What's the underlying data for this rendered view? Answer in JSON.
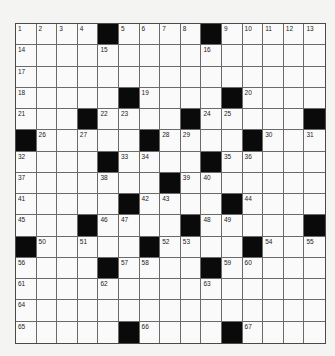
{
  "puzzle": {
    "rows": 15,
    "cols": 15,
    "colors": {
      "black": "#0a0a0a",
      "white": "#fafafa",
      "line": "#6a6a6a"
    },
    "layout": [
      "....#....#.....",
      "...............",
      "...............",
      ".....#....#....",
      "...#....#.....#",
      "#.....#....#...",
      "....#....#.....",
      ".......#.......",
      ".....#....#....",
      "...#....#.....#",
      "#.....#....#...",
      "....#....#.....",
      "...............",
      "...............",
      ".....#....#...."
    ],
    "numbers": [
      {
        "r": 0,
        "c": 0,
        "n": "1"
      },
      {
        "r": 0,
        "c": 1,
        "n": "2"
      },
      {
        "r": 0,
        "c": 2,
        "n": "3"
      },
      {
        "r": 0,
        "c": 3,
        "n": "4"
      },
      {
        "r": 0,
        "c": 5,
        "n": "5"
      },
      {
        "r": 0,
        "c": 6,
        "n": "6"
      },
      {
        "r": 0,
        "c": 7,
        "n": "7"
      },
      {
        "r": 0,
        "c": 8,
        "n": "8"
      },
      {
        "r": 0,
        "c": 10,
        "n": "9"
      },
      {
        "r": 0,
        "c": 11,
        "n": "10"
      },
      {
        "r": 0,
        "c": 12,
        "n": "11"
      },
      {
        "r": 0,
        "c": 13,
        "n": "12"
      },
      {
        "r": 0,
        "c": 14,
        "n": "13"
      },
      {
        "r": 1,
        "c": 0,
        "n": "14"
      },
      {
        "r": 1,
        "c": 4,
        "n": "15"
      },
      {
        "r": 1,
        "c": 9,
        "n": "16"
      },
      {
        "r": 2,
        "c": 0,
        "n": "17"
      },
      {
        "r": 3,
        "c": 0,
        "n": "18"
      },
      {
        "r": 3,
        "c": 6,
        "n": "19"
      },
      {
        "r": 3,
        "c": 11,
        "n": "20"
      },
      {
        "r": 4,
        "c": 0,
        "n": "21"
      },
      {
        "r": 4,
        "c": 4,
        "n": "22"
      },
      {
        "r": 4,
        "c": 5,
        "n": "23"
      },
      {
        "r": 4,
        "c": 9,
        "n": "24"
      },
      {
        "r": 4,
        "c": 10,
        "n": "25"
      },
      {
        "r": 5,
        "c": 1,
        "n": "26"
      },
      {
        "r": 5,
        "c": 3,
        "n": "27"
      },
      {
        "r": 5,
        "c": 7,
        "n": "28"
      },
      {
        "r": 5,
        "c": 8,
        "n": "29"
      },
      {
        "r": 5,
        "c": 12,
        "n": "30"
      },
      {
        "r": 5,
        "c": 14,
        "n": "31"
      },
      {
        "r": 6,
        "c": 0,
        "n": "32"
      },
      {
        "r": 6,
        "c": 5,
        "n": "33"
      },
      {
        "r": 6,
        "c": 6,
        "n": "34"
      },
      {
        "r": 6,
        "c": 10,
        "n": "35"
      },
      {
        "r": 6,
        "c": 11,
        "n": "36"
      },
      {
        "r": 7,
        "c": 0,
        "n": "37"
      },
      {
        "r": 7,
        "c": 4,
        "n": "38"
      },
      {
        "r": 7,
        "c": 8,
        "n": "39"
      },
      {
        "r": 7,
        "c": 9,
        "n": "40"
      },
      {
        "r": 8,
        "c": 0,
        "n": "41"
      },
      {
        "r": 8,
        "c": 6,
        "n": "42"
      },
      {
        "r": 8,
        "c": 7,
        "n": "43"
      },
      {
        "r": 8,
        "c": 11,
        "n": "44"
      },
      {
        "r": 9,
        "c": 0,
        "n": "45"
      },
      {
        "r": 9,
        "c": 4,
        "n": "46"
      },
      {
        "r": 9,
        "c": 5,
        "n": "47"
      },
      {
        "r": 9,
        "c": 9,
        "n": "48"
      },
      {
        "r": 9,
        "c": 10,
        "n": "49"
      },
      {
        "r": 10,
        "c": 1,
        "n": "50"
      },
      {
        "r": 10,
        "c": 3,
        "n": "51"
      },
      {
        "r": 10,
        "c": 7,
        "n": "52"
      },
      {
        "r": 10,
        "c": 8,
        "n": "53"
      },
      {
        "r": 10,
        "c": 12,
        "n": "54"
      },
      {
        "r": 10,
        "c": 14,
        "n": "55"
      },
      {
        "r": 11,
        "c": 0,
        "n": "56"
      },
      {
        "r": 11,
        "c": 5,
        "n": "57"
      },
      {
        "r": 11,
        "c": 6,
        "n": "58"
      },
      {
        "r": 11,
        "c": 10,
        "n": "59"
      },
      {
        "r": 11,
        "c": 11,
        "n": "60"
      },
      {
        "r": 12,
        "c": 0,
        "n": "61"
      },
      {
        "r": 12,
        "c": 4,
        "n": "62"
      },
      {
        "r": 12,
        "c": 9,
        "n": "63"
      },
      {
        "r": 13,
        "c": 0,
        "n": "64"
      },
      {
        "r": 14,
        "c": 0,
        "n": "65"
      },
      {
        "r": 14,
        "c": 6,
        "n": "66"
      },
      {
        "r": 14,
        "c": 11,
        "n": "67"
      }
    ]
  }
}
